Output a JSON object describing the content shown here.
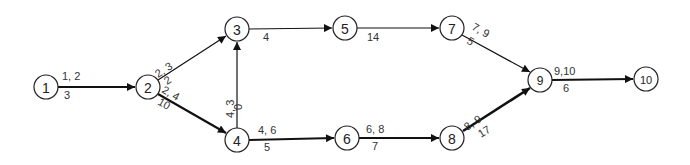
{
  "nodes": [
    {
      "id": "1",
      "label": "1",
      "x": 46,
      "y": 87
    },
    {
      "id": "2",
      "label": "2",
      "x": 148,
      "y": 87
    },
    {
      "id": "3",
      "label": "3",
      "x": 237,
      "y": 29
    },
    {
      "id": "4",
      "label": "4",
      "x": 237,
      "y": 140
    },
    {
      "id": "5",
      "label": "5",
      "x": 345,
      "y": 28
    },
    {
      "id": "6",
      "label": "6",
      "x": 347,
      "y": 138
    },
    {
      "id": "7",
      "label": "7",
      "x": 452,
      "y": 28
    },
    {
      "id": "8",
      "label": "8",
      "x": 452,
      "y": 138
    },
    {
      "id": "9",
      "label": "9",
      "x": 540,
      "y": 80
    },
    {
      "id": "10",
      "label": "10",
      "x": 646,
      "y": 79
    }
  ],
  "edges": [
    {
      "from": "1",
      "to": "2",
      "activity": "1, 2",
      "duration": "3",
      "critical": true
    },
    {
      "from": "2",
      "to": "3",
      "activity": "2, 3",
      "duration": "2",
      "critical": false
    },
    {
      "from": "2",
      "to": "4",
      "activity": "2, 4",
      "duration": "10",
      "critical": true
    },
    {
      "from": "4",
      "to": "3",
      "activity": "4, 3",
      "duration": "0",
      "critical": false
    },
    {
      "from": "3",
      "to": "5",
      "activity": "",
      "duration": "4",
      "critical": false
    },
    {
      "from": "5",
      "to": "7",
      "activity": "",
      "duration": "14",
      "critical": false
    },
    {
      "from": "4",
      "to": "6",
      "activity": "4, 6",
      "duration": "5",
      "critical": true
    },
    {
      "from": "6",
      "to": "8",
      "activity": "6, 8",
      "duration": "7",
      "critical": true
    },
    {
      "from": "7",
      "to": "9",
      "activity": "7, 9",
      "duration": "5",
      "critical": false
    },
    {
      "from": "8",
      "to": "9",
      "activity": "8, 9",
      "duration": "17",
      "critical": true
    },
    {
      "from": "9",
      "to": "10",
      "activity": "9,10",
      "duration": "6",
      "critical": true
    }
  ]
}
